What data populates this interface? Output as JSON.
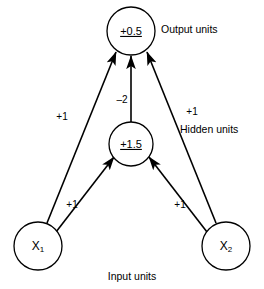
{
  "diagram": {
    "type": "neural-network",
    "nodes": {
      "output": {
        "id": "output",
        "value": "+0.5",
        "cx": 131,
        "cy": 31,
        "r": 24
      },
      "hidden": {
        "id": "hidden",
        "value": "+1.5",
        "cx": 131,
        "cy": 144,
        "r": 22
      },
      "input_left": {
        "id": "x1",
        "var": "X",
        "sub": "1",
        "cx": 38,
        "cy": 246,
        "r": 24
      },
      "input_right": {
        "id": "x2",
        "var": "X",
        "sub": "2",
        "cx": 226,
        "cy": 246,
        "r": 24
      }
    },
    "edges": [
      {
        "id": "x1-to-output",
        "from": "x1",
        "to": "output",
        "weight": "+1",
        "label_x": 62,
        "label_y": 117
      },
      {
        "id": "x2-to-output",
        "from": "x2",
        "to": "output",
        "weight": "+1",
        "label_x": 192,
        "label_y": 112
      },
      {
        "id": "hidden-to-output",
        "from": "hidden",
        "to": "output",
        "weight": "–2",
        "label_x": 122,
        "label_y": 100
      },
      {
        "id": "x1-to-hidden",
        "from": "x1",
        "to": "hidden",
        "weight": "+1",
        "label_x": 72,
        "label_y": 205
      },
      {
        "id": "x2-to-hidden",
        "from": "x2",
        "to": "hidden",
        "weight": "+1",
        "label_x": 180,
        "label_y": 205
      }
    ],
    "labels": {
      "output_units": {
        "text": "Output units",
        "x": 161,
        "y": 30
      },
      "hidden_units": {
        "text": "Hidden units",
        "x": 180,
        "y": 130
      },
      "input_units": {
        "text": "Input units",
        "x": 132,
        "y": 277
      }
    },
    "colors": {
      "stroke": "#000000",
      "fill": "#ffffff",
      "background": "#ffffff"
    }
  }
}
